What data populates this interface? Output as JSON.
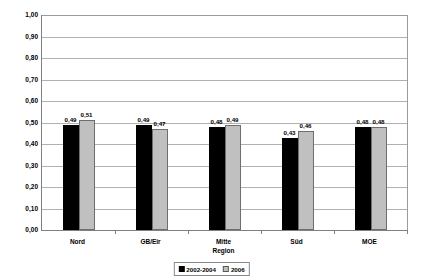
{
  "chart_data": {
    "type": "bar",
    "title": "",
    "xlabel": "Region",
    "ylabel": "Politische Kompetenz",
    "ylim": [
      0,
      1.0
    ],
    "ytick_step": 0.1,
    "grid": true,
    "legend_position": "bottom-center",
    "decimal_separator": ",",
    "categories": [
      "Nord",
      "GB/Eir",
      "Mitte",
      "Süd",
      "MOE"
    ],
    "ytick_labels": [
      "0,00",
      "0,10",
      "0,20",
      "0,30",
      "0,40",
      "0,50",
      "0,60",
      "0,70",
      "0,80",
      "0,90",
      "1,00"
    ],
    "ytick_values": [
      0.0,
      0.1,
      0.2,
      0.3,
      0.4,
      0.5,
      0.6,
      0.7,
      0.8,
      0.9,
      1.0
    ],
    "series": [
      {
        "name": "2002-2004",
        "color": "#000000",
        "values": [
          0.49,
          0.49,
          0.48,
          0.43,
          0.48
        ],
        "labels": [
          "0,49",
          "0,49",
          "0,48",
          "0,43",
          "0,48"
        ]
      },
      {
        "name": "2006",
        "color": "#c0c0c0",
        "values": [
          0.51,
          0.47,
          0.49,
          0.46,
          0.48
        ],
        "labels": [
          "0,51",
          "0,47",
          "0,49",
          "0,46",
          "0,48"
        ]
      }
    ]
  }
}
